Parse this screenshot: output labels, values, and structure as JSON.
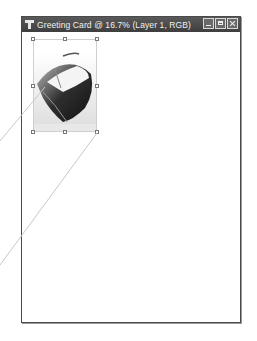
{
  "window": {
    "title": "Greeting Card @ 16.7% (Layer 1, RGB)",
    "document_name": "Greeting Card",
    "zoom_level": "16.7%",
    "layer": "Layer 1",
    "color_mode": "RGB",
    "controls": {
      "minimize": "minimize-icon",
      "maximize": "maximize-icon",
      "close": "close-icon"
    }
  },
  "canvas": {
    "layer_content": "boat photo",
    "transform_handles": 8
  },
  "colors": {
    "titlebar": "#4a4a4a",
    "title_text": "#f2f2f2",
    "canvas": "#ffffff",
    "callout_lines": "#c8c8c8"
  }
}
